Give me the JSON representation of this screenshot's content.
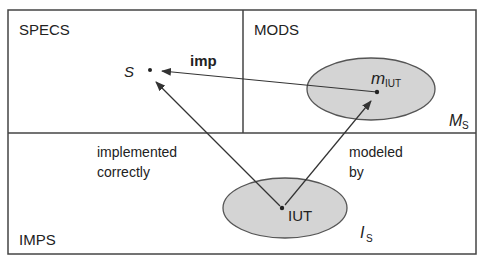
{
  "diagram": {
    "regions": {
      "specs": "SPECS",
      "mods": "MODS",
      "imps": "IMPS"
    },
    "nodes": {
      "s": "S",
      "m_iut_main": "m",
      "m_iut_sub": "IUT",
      "iut": "IUT"
    },
    "sets": {
      "ms_main": "M",
      "ms_sub": "S",
      "is_main": "I",
      "is_sub": "S"
    },
    "edges": {
      "imp": "imp",
      "implemented_line1": "implemented",
      "implemented_line2": "correctly",
      "modeled_line1": "modeled",
      "modeled_line2": "by"
    },
    "colors": {
      "line": "#333333",
      "ellipse_fill": "#d4d4d4",
      "ellipse_stroke": "#555555",
      "text": "#222222"
    }
  }
}
